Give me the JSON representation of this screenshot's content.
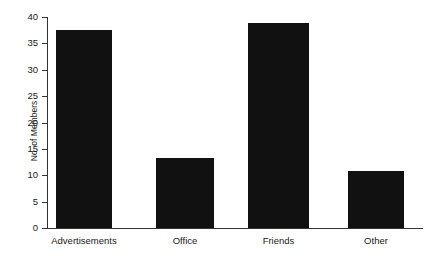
{
  "chart_data": {
    "type": "bar",
    "title": "",
    "subtitle": "",
    "xlabel": "",
    "ylabel": "No. of Members",
    "categories": [
      "Advertisements",
      "Office",
      "Friends",
      "Other"
    ],
    "values": [
      37.5,
      13.3,
      38.8,
      10.9
    ],
    "ylim": [
      0,
      40
    ],
    "ytick_values": [
      0,
      5,
      10,
      15,
      20,
      25,
      30,
      35,
      40
    ],
    "ytick_labels": [
      "0",
      "5",
      "10",
      "15",
      "20",
      "25",
      "30",
      "35",
      "40"
    ],
    "xtick_labels": [
      "Advertisements",
      "Office",
      "Friends",
      "Other"
    ],
    "grid": false,
    "legend": false,
    "legend_position": "none",
    "annotations": [],
    "bar_color": "#111111",
    "axis_color": "#333333",
    "text_color": "#1a1a1a",
    "background_color": "#ffffff",
    "tick_direction": "out",
    "spines": [
      "left",
      "bottom"
    ]
  }
}
